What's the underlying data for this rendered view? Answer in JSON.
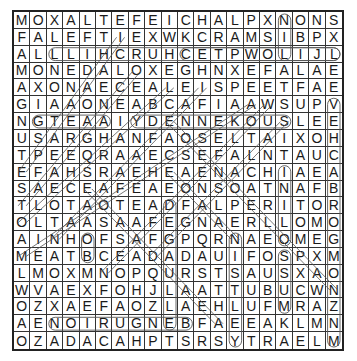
{
  "puzzle": {
    "rows": 20,
    "cols": 20,
    "grid": [
      "MOXALTEFEICHALPXNONS",
      "FALEFTIEXWKCRAMSIBPX",
      "ALLLIHCRUHCETPWOLIJL",
      "MONEDALOXEGHNXEFALAE",
      "AXONAECEALEISPEETFAE",
      "GIAAONEABCAFIAAWSUPV",
      "NGTEAAIYDENNEKOUSLEE",
      "USARGHANFAOSELTAIXOH",
      "TPEEQRAAECSEFALNTAUC",
      "EFAHSRAEHEAENACHIAEA",
      "SAECEAFEAEONSOATNAFB",
      "TLOTAOTEADFALPERITOR",
      "OLTAASAAFEGNAERLLOMO",
      "AINHOFSAFGPQRNAEOMEG",
      "MEATBCEADADAUIFOSPXM",
      "LMOXMNOPQURSTSAUSXAO",
      "WVAEXFOHJLAATTUBUCWN",
      "OZXAEFAOZLAEHLUFMRAZ",
      "AENOIRUGNEBFAEEAKLMN",
      "OZADACAHPTSRSYTRAELM"
    ],
    "colors": {
      "letter": "#1a1a1a",
      "grid_line": "#333333",
      "mark": "#555555",
      "background": "#ffffff"
    },
    "marks": {
      "horizontal_loops": [
        {
          "row": 2,
          "from_col": 2,
          "to_col": 19
        },
        {
          "row": 2,
          "from_col": 10,
          "to_col": 19
        },
        {
          "row": 6,
          "from_col": 1,
          "to_col": 5
        },
        {
          "row": 6,
          "from_col": 7,
          "to_col": 16
        },
        {
          "row": 18,
          "from_col": 2,
          "to_col": 10
        }
      ],
      "vertical_loops": [
        {
          "col": 16,
          "from_row": 0,
          "to_row": 2
        },
        {
          "col": 19,
          "from_row": 5,
          "to_row": 19
        },
        {
          "col": 16,
          "from_row": 9,
          "to_row": 13
        },
        {
          "col": 4,
          "from_row": 13,
          "to_row": 14
        },
        {
          "col": 9,
          "from_row": 11,
          "to_row": 18
        },
        {
          "col": 13,
          "from_row": 13,
          "to_row": 19
        },
        {
          "col": 16,
          "from_row": 14,
          "to_row": 17
        }
      ],
      "diagonal_lines": [
        {
          "from": [
            1,
            6
          ],
          "to": [
            9,
            0
          ]
        },
        {
          "from": [
            3,
            7
          ],
          "to": [
            11,
            0
          ]
        },
        {
          "from": [
            4,
            9
          ],
          "to": [
            12,
            0
          ]
        },
        {
          "from": [
            4,
            11
          ],
          "to": [
            13,
            2
          ]
        },
        {
          "from": [
            5,
            14
          ],
          "to": [
            14,
            0
          ]
        },
        {
          "from": [
            6,
            16
          ],
          "to": [
            14,
            8
          ]
        },
        {
          "from": [
            6,
            9
          ],
          "to": [
            16,
            19
          ]
        },
        {
          "from": [
            9,
            9
          ],
          "to": [
            13,
            13
          ]
        },
        {
          "from": [
            10,
            4
          ],
          "to": [
            18,
            12
          ]
        },
        {
          "from": [
            5,
            15
          ],
          "to": [
            15,
            5
          ]
        }
      ]
    }
  }
}
